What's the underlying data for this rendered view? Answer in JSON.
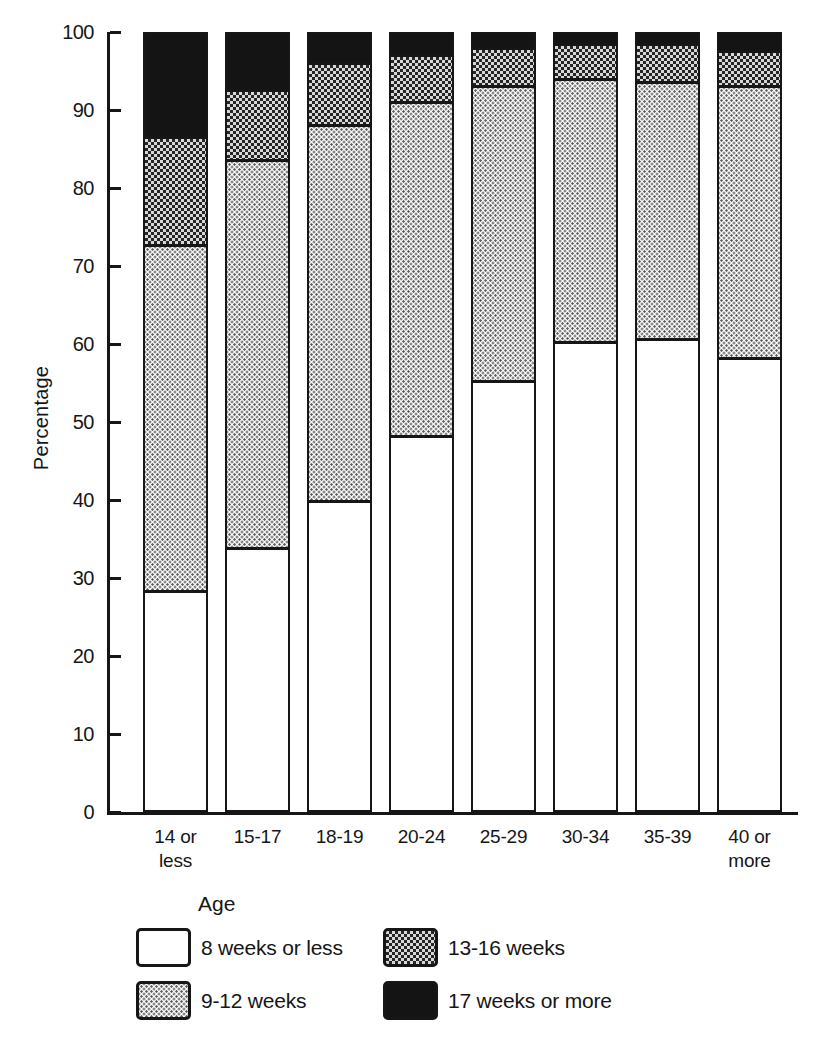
{
  "colors": {
    "ink": "#161616",
    "paper": "#ffffff"
  },
  "legend": {
    "title": "Age"
  },
  "chart_data": {
    "type": "bar",
    "stacked": true,
    "orientation": "vertical",
    "title": "",
    "xlabel": "",
    "ylabel": "Percentage",
    "ylim": [
      0,
      100
    ],
    "yticks": [
      0,
      10,
      20,
      30,
      40,
      50,
      60,
      70,
      80,
      90,
      100
    ],
    "grid": false,
    "legend_position": "bottom",
    "categories": [
      [
        "14 or",
        "less"
      ],
      [
        "15-17"
      ],
      [
        "18-19"
      ],
      [
        "20-24"
      ],
      [
        "25-29"
      ],
      [
        "30-34"
      ],
      [
        "35-39"
      ],
      [
        "40 or",
        "more"
      ]
    ],
    "series": [
      {
        "name": "8 weeks or less",
        "pattern": "solid-white",
        "values": [
          28,
          33.5,
          39.5,
          48,
          55,
          60,
          60.5,
          58
        ]
      },
      {
        "name": "9-12 weeks",
        "pattern": "light-dots",
        "values": [
          44.5,
          50,
          48.5,
          43,
          38,
          34,
          33,
          35
        ]
      },
      {
        "name": "13-16 weeks",
        "pattern": "checker",
        "values": [
          14,
          9,
          8,
          6,
          5,
          4.5,
          5,
          4.5
        ]
      },
      {
        "name": "17 weeks or more",
        "pattern": "solid-black",
        "values": [
          13.5,
          7.5,
          4,
          3,
          2,
          1.5,
          1.5,
          2.5
        ]
      }
    ]
  }
}
